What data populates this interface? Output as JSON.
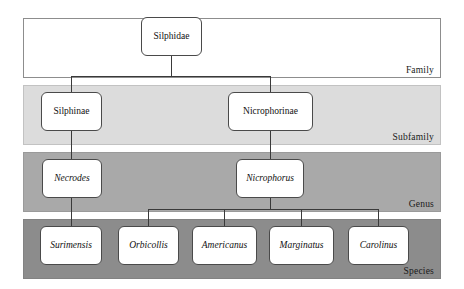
{
  "diagram": {
    "type": "taxonomic-hierarchy",
    "ranks": [
      {
        "id": "family",
        "label": "Family"
      },
      {
        "id": "subfamily",
        "label": "Subfamily"
      },
      {
        "id": "genus",
        "label": "Genus"
      },
      {
        "id": "species",
        "label": "Species"
      }
    ],
    "nodes": {
      "family": [
        {
          "id": "silphidae",
          "label": "Silphidae",
          "italic": false
        }
      ],
      "subfamily": [
        {
          "id": "silphinae",
          "label": "Silphinae",
          "italic": false
        },
        {
          "id": "nicrophorinae",
          "label": "Nicrophorinae",
          "italic": false
        }
      ],
      "genus": [
        {
          "id": "necrodes",
          "label": "Necrodes",
          "italic": true
        },
        {
          "id": "nicrophorus",
          "label": "Nicrophorus",
          "italic": true
        }
      ],
      "species": [
        {
          "id": "surimensis",
          "label": "Surimensis",
          "italic": true
        },
        {
          "id": "orbicollis",
          "label": "Orbicollis",
          "italic": true
        },
        {
          "id": "americanus",
          "label": "Americanus",
          "italic": true
        },
        {
          "id": "marginatus",
          "label": "Marginatus",
          "italic": true
        },
        {
          "id": "carolinus",
          "label": "Carolinus",
          "italic": true
        }
      ]
    },
    "edges": [
      {
        "from": "silphidae",
        "to": "silphinae"
      },
      {
        "from": "silphidae",
        "to": "nicrophorinae"
      },
      {
        "from": "silphinae",
        "to": "necrodes"
      },
      {
        "from": "nicrophorinae",
        "to": "nicrophorus"
      },
      {
        "from": "necrodes",
        "to": "surimensis"
      },
      {
        "from": "nicrophorus",
        "to": "orbicollis"
      },
      {
        "from": "nicrophorus",
        "to": "americanus"
      },
      {
        "from": "nicrophorus",
        "to": "marginatus"
      },
      {
        "from": "nicrophorus",
        "to": "carolinus"
      }
    ],
    "colors": {
      "band_family": "#ffffff",
      "band_subfamily": "#dcdcdc",
      "band_genus": "#a9a9a9",
      "band_species": "#8c8c8c",
      "node_fill": "#ffffff",
      "node_border": "#4a4a4a",
      "connector": "#3a3a3a",
      "text": "#111111"
    }
  }
}
